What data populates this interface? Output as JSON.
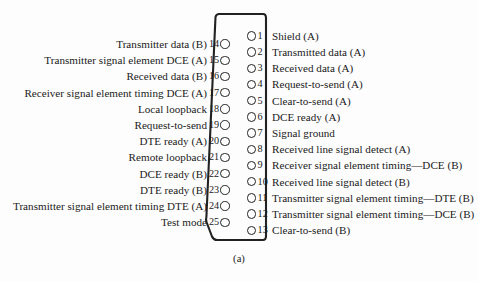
{
  "figure": {
    "caption": "(a)",
    "connector_type": "DB-25",
    "ink_color": "#222222",
    "background_color": "#fdfdfd"
  },
  "left_column": {
    "description": "Pins 14 through 25, labels right-aligned outside the shell",
    "pins": [
      {
        "number": "14",
        "label": "Transmitter data (B)"
      },
      {
        "number": "15",
        "label": "Transmitter signal element DCE (A)"
      },
      {
        "number": "16",
        "label": "Received data (B)"
      },
      {
        "number": "17",
        "label": "Receiver signal element timing DCE (A)"
      },
      {
        "number": "18",
        "label": "Local loopback"
      },
      {
        "number": "19",
        "label": "Request-to-send"
      },
      {
        "number": "20",
        "label": "DTE ready (A)"
      },
      {
        "number": "21",
        "label": "Remote loopback"
      },
      {
        "number": "22",
        "label": "DCE ready (B)"
      },
      {
        "number": "23",
        "label": "DTE ready (B)"
      },
      {
        "number": "24",
        "label": "Transmitter signal element timing DTE (A)"
      },
      {
        "number": "25",
        "label": "Test mode"
      }
    ]
  },
  "right_column": {
    "description": "Pins 1 through 13, labels left-aligned outside the shell",
    "pins": [
      {
        "number": "1",
        "label": "Shield (A)"
      },
      {
        "number": "2",
        "label": "Transmitted data (A)"
      },
      {
        "number": "3",
        "label": "Received data (A)"
      },
      {
        "number": "4",
        "label": "Request-to-send (A)"
      },
      {
        "number": "5",
        "label": "Clear-to-send (A)"
      },
      {
        "number": "6",
        "label": "DCE ready (A)"
      },
      {
        "number": "7",
        "label": "Signal ground"
      },
      {
        "number": "8",
        "label": "Received line signal detect (A)"
      },
      {
        "number": "9",
        "label": "Receiver signal element timing—DCE (B)"
      },
      {
        "number": "10",
        "label": "Received line signal detect (B)"
      },
      {
        "number": "11",
        "label": "Transmitter signal element timing—DTE (B)"
      },
      {
        "number": "12",
        "label": "Transmitter signal element timing—DCE (B)"
      },
      {
        "number": "13",
        "label": "Clear-to-send (B)"
      }
    ]
  }
}
